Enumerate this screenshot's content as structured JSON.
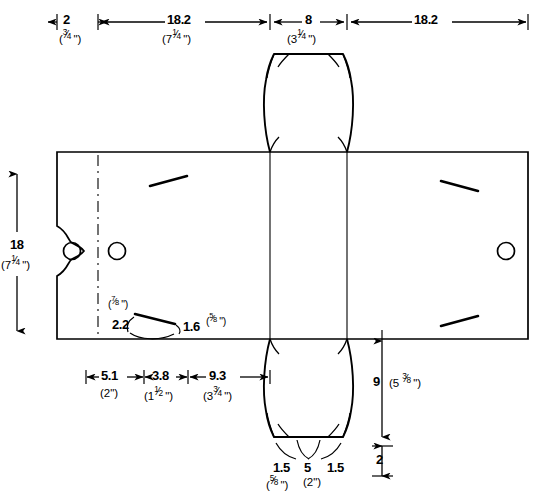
{
  "drawing": {
    "title": "Carton die-cut flat pattern",
    "units_note": "metric with inch equivalents in parentheses",
    "stroke_color": "#000000",
    "background": "#ffffff"
  },
  "top_dimensions": [
    {
      "id": "d_top_1",
      "value": "2",
      "sub_whole": "",
      "sub_num": "3",
      "sub_den": "4",
      "sub_unit": "\""
    },
    {
      "id": "d_top_2",
      "value": "18.2",
      "sub_whole": "7",
      "sub_num": "1",
      "sub_den": "4",
      "sub_unit": "\""
    },
    {
      "id": "d_top_3",
      "value": "8",
      "sub_whole": "3",
      "sub_num": "1",
      "sub_den": "4",
      "sub_unit": "\""
    },
    {
      "id": "d_top_4",
      "value": "18.2",
      "sub_whole": "",
      "sub_num": "",
      "sub_den": "",
      "sub_unit": ""
    }
  ],
  "left_dimension": {
    "id": "d_left_height",
    "value": "18",
    "sub_whole": "7",
    "sub_num": "1",
    "sub_den": "4",
    "sub_unit": "\""
  },
  "bottom_dimensions": [
    {
      "id": "d_bot_1",
      "value": "5.1",
      "sub_whole": "2",
      "sub_num": "",
      "sub_den": "",
      "sub_unit": "\""
    },
    {
      "id": "d_bot_2",
      "value": "3.8",
      "sub_whole": "1",
      "sub_num": "1",
      "sub_den": "2",
      "sub_unit": "\""
    },
    {
      "id": "d_bot_3",
      "value": "9.3",
      "sub_whole": "3",
      "sub_num": "3",
      "sub_den": "4",
      "sub_unit": "\""
    }
  ],
  "slot_callout": {
    "id": "slot_detail",
    "width_value": "2.2",
    "width_sub_num": "7",
    "width_sub_den": "8",
    "width_sub_unit": "\"",
    "height_value": "1.6",
    "height_sub_num": "5",
    "height_sub_den": "8",
    "height_sub_unit": "\""
  },
  "right_dimensions": [
    {
      "id": "d_right_flap",
      "value": "9",
      "paren_whole": "5",
      "paren_num": "3",
      "paren_den": "8",
      "paren_unit": "\"",
      "has_paren": true
    },
    {
      "id": "d_right_tab",
      "value": "2",
      "has_paren": false
    }
  ],
  "bottom_flap_dimensions": [
    {
      "id": "d_flap_1",
      "value": "1.5",
      "sub_num": "5",
      "sub_den": "8",
      "sub_unit": "\"",
      "has_sub": true
    },
    {
      "id": "d_flap_2",
      "value": "5",
      "sub_whole": "2",
      "sub_unit": "\"",
      "has_sub": true
    },
    {
      "id": "d_flap_3",
      "value": "1.5",
      "has_sub": false
    }
  ],
  "features": {
    "holes": [
      {
        "name": "handle-hole-left",
        "cx": 72,
        "cy": 251,
        "r": 8
      },
      {
        "name": "handle-hole-inner",
        "cx": 117,
        "cy": 251,
        "r": 8
      },
      {
        "name": "handle-hole-right",
        "cx": 506,
        "cy": 251,
        "r": 8
      }
    ],
    "slits": [
      {
        "name": "slit-top-left",
        "x1": 150,
        "y1": 185,
        "x2": 186,
        "y2": 176
      },
      {
        "name": "slit-top-right",
        "x1": 440,
        "y1": 181,
        "x2": 477,
        "y2": 190
      },
      {
        "name": "slit-bottom-right",
        "x1": 440,
        "y1": 325,
        "x2": 477,
        "y2": 315
      }
    ],
    "fold_lines": [
      {
        "name": "fold-left-dashed",
        "x": 98
      },
      {
        "name": "fold-panel-left",
        "x": 270
      },
      {
        "name": "fold-panel-right",
        "x": 347
      }
    ]
  }
}
